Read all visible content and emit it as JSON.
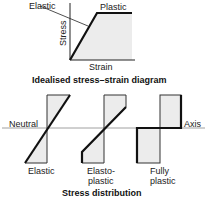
{
  "diagram": {
    "top": {
      "caption": "Idealised stress–strain diagram",
      "x_label": "Strain",
      "y_label": "Stress",
      "annotations": {
        "elastic": "Elastic",
        "plastic": "Plastic"
      }
    },
    "bottom": {
      "caption": "Stress distribution",
      "axis_left": "Neutral",
      "axis_right": "Axis",
      "panels": [
        {
          "label_line1": "Elastic",
          "label_line2": ""
        },
        {
          "label_line1": "Elasto-",
          "label_line2": "plastic"
        },
        {
          "label_line1": "Fully",
          "label_line2": "plastic"
        }
      ]
    },
    "colors": {
      "line": "#111111",
      "fill": "#ececec",
      "axis": "#888888"
    }
  }
}
